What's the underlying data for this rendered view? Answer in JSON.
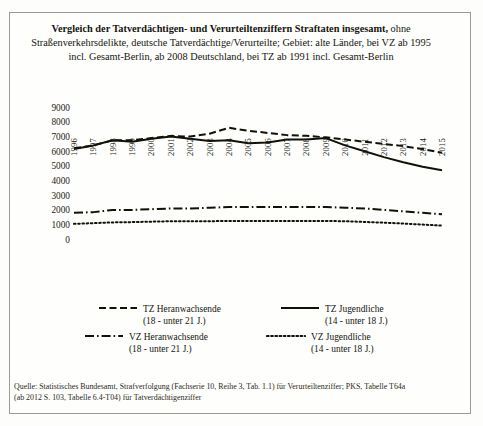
{
  "figure": {
    "title_bold": "Vergleich der Tatverdächtigen- und Verurteiltenziffern Straftaten insgesamt,",
    "title_rest": " ohne Straßenverkehrsdelikte, deutsche Tatverdächtige/Verurteilte; Gebiet: alte Länder, bei VZ ab 1995 incl. Gesamt-Berlin, ab 2008 Deutschland, bei TZ ab 1991 incl. Gesamt-Berlin",
    "source_line_1": "Quelle: Statistisches Bundesamt, Strafverfolgung (Fachserie 10, Reihe 3, Tab. 1.1) für Verurteiltenziffer; PKS, Tabelle T64a",
    "source_line_2": "(ab 2012 S. 103, Tabelle 6.4-T04) für Tatverdächtigenziffer",
    "line_color": "#111108",
    "frame_color": "#9a9a96"
  },
  "legend": {
    "entries": [
      {
        "name": "tz-heranwachsende",
        "label": "TZ Heranwachsende",
        "sub": "(18 - unter 21 J.)",
        "style": "dashed"
      },
      {
        "name": "tz-jugendliche",
        "label": "TZ Jugendliche",
        "sub": "(14 - unter 18 J.)",
        "style": "solid"
      },
      {
        "name": "vz-heranwachsende",
        "label": "VZ Heranwachsende",
        "sub": "(18 - unter 21 J.)",
        "style": "dashdot"
      },
      {
        "name": "vz-jugendliche",
        "label": "VZ Jugendliche",
        "sub": "(14 - unter 18 J.)",
        "style": "dotted"
      }
    ]
  },
  "chart_data": {
    "type": "line",
    "title": "Vergleich der Tatverdächtigen- und Verurteiltenziffern Straftaten insgesamt, ohne Straßenverkehrsdelikte, deutsche Tatverdächtige/Verurteilte; Gebiet: alte Länder, bei VZ ab 1995 incl. Gesamt-Berlin, ab 2008 Deutschland, bei TZ ab 1991 incl. Gesamt-Berlin",
    "xlabel": "",
    "ylabel": "",
    "ylim": [
      0,
      9000
    ],
    "yticks": [
      0,
      1000,
      2000,
      3000,
      4000,
      5000,
      6000,
      7000,
      8000,
      9000
    ],
    "grid": false,
    "legend_position": "bottom",
    "categories": [
      1996,
      1997,
      1998,
      1999,
      2000,
      2001,
      2002,
      2003,
      2004,
      2005,
      2006,
      2007,
      2008,
      2009,
      2010,
      2011,
      2012,
      2013,
      2014,
      2015
    ],
    "series": [
      {
        "name": "TZ Heranwachsende (18 - unter 21 J.)",
        "style": "dashed",
        "values": [
          6250,
          6450,
          6800,
          6800,
          6950,
          7100,
          7050,
          7250,
          7650,
          7450,
          7300,
          7150,
          7100,
          7000,
          6850,
          6700,
          6550,
          6400,
          6200,
          5950
        ]
      },
      {
        "name": "TZ Jugendliche (14 - unter 18 J.)",
        "style": "solid",
        "values": [
          6200,
          6450,
          6800,
          6700,
          6900,
          7050,
          6900,
          6750,
          6800,
          6600,
          6650,
          6850,
          6850,
          6950,
          6450,
          6050,
          5650,
          5300,
          5000,
          4750
        ]
      },
      {
        "name": "VZ Heranwachsende (18 - unter 21 J.)",
        "style": "dashdot",
        "values": [
          1850,
          1900,
          2050,
          2050,
          2100,
          2150,
          2150,
          2200,
          2250,
          2250,
          2250,
          2250,
          2250,
          2250,
          2200,
          2150,
          2050,
          1950,
          1850,
          1750
        ]
      },
      {
        "name": "VZ Jugendliche (14 - unter 18 J.)",
        "style": "dotted",
        "values": [
          1100,
          1150,
          1200,
          1220,
          1250,
          1280,
          1280,
          1280,
          1300,
          1300,
          1300,
          1300,
          1300,
          1300,
          1280,
          1230,
          1180,
          1120,
          1050,
          980
        ]
      }
    ]
  }
}
